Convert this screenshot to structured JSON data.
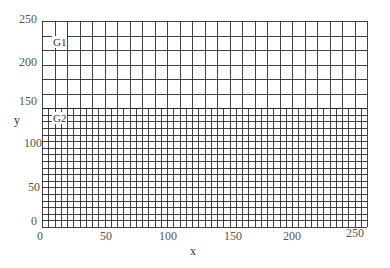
{
  "chart_data": {
    "type": "grid-diagram",
    "title": "",
    "xlabel": "x",
    "ylabel": "y",
    "xlim": [
      0,
      258
    ],
    "ylim": [
      -6,
      247
    ],
    "x_ticks": [
      "0",
      "50",
      "100",
      "150",
      "200",
      "250"
    ],
    "y_ticks": [
      "0",
      "50",
      "100",
      "150",
      "200",
      "250"
    ],
    "regions": [
      {
        "name": "G1",
        "x_range": [
          0,
          258
        ],
        "y_range": [
          140,
          247
        ],
        "columns": 26,
        "rows": 6,
        "cell_width": 10,
        "cell_height": 18
      },
      {
        "name": "G2",
        "x_range": [
          0,
          258
        ],
        "y_range": [
          -6,
          140
        ],
        "columns": 52,
        "rows": 18,
        "cell_width": 5,
        "cell_height": 8
      }
    ],
    "grid": true
  },
  "labels": {
    "x_axis": "x",
    "y_axis": "y",
    "g1": "G1",
    "g2": "G2",
    "xticks": [
      "0",
      "50",
      "100",
      "150",
      "200",
      "250"
    ],
    "yticks": [
      "250",
      "200",
      "150",
      "100",
      "50",
      "0"
    ]
  },
  "colors": {
    "grid_line": "#222222",
    "background": "#ffffff",
    "tick_text": "#555555"
  }
}
